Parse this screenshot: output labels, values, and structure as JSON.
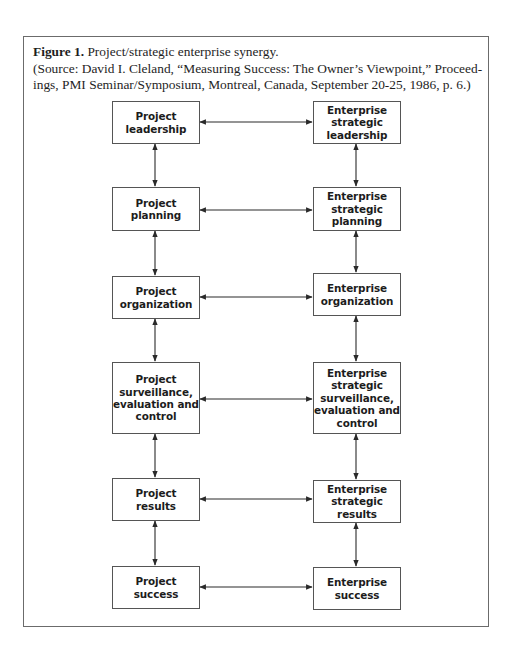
{
  "figure": {
    "label": "Figure 1.",
    "title": " Project/strategic enterprise synergy.",
    "source_line_1": "(Source: David I. Cleland, “Measuring Success: The Owner’s Viewpoint,” Proceed-",
    "source_line_2": "ings, PMI Seminar/Symposium, Montreal, Canada, September 20-25, 1986, p. 6.)"
  },
  "diagram": {
    "left_column": [
      {
        "label": "Project\nleadership"
      },
      {
        "label": "Project\nplanning"
      },
      {
        "label": "Project\norganization"
      },
      {
        "label": "Project\nsurveillance,\nevaluation and\ncontrol"
      },
      {
        "label": "Project\nresults"
      },
      {
        "label": "Project\nsuccess"
      }
    ],
    "right_column": [
      {
        "label": "Enterprise\nstrategic\nleadership"
      },
      {
        "label": "Enterprise\nstrategic\nplanning"
      },
      {
        "label": "Enterprise\norganization"
      },
      {
        "label": "Enterprise\nstrategic\nsurveillance,\nevaluation and\ncontrol"
      },
      {
        "label": "Enterprise\nstrategic\nresults"
      },
      {
        "label": "Enterprise\nsuccess"
      }
    ],
    "connections": "bidirectional arrows between each left/right pair and between vertically adjacent boxes in each column"
  },
  "colors": {
    "line": "#2a2a2a",
    "border": "#555555",
    "frame": "#6b6b6b"
  }
}
